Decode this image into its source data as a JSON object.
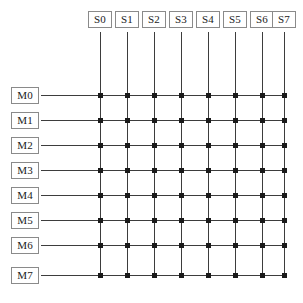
{
  "diagram": {
    "type": "bus-matrix",
    "colors": {
      "line": "#3d3d3d",
      "node": "#1a1a1a",
      "box_border": "#8a8a8a",
      "background": "#ffffff",
      "text": "#1a1a1a"
    },
    "columns": [
      {
        "label": "S0",
        "x": 100
      },
      {
        "label": "S1",
        "x": 127
      },
      {
        "label": "S2",
        "x": 154
      },
      {
        "label": "S3",
        "x": 181
      },
      {
        "label": "S4",
        "x": 208
      },
      {
        "label": "S5",
        "x": 235
      },
      {
        "label": "S6",
        "x": 262
      },
      {
        "label": "S7",
        "x": 284
      }
    ],
    "rows": [
      {
        "label": "M0",
        "y": 95
      },
      {
        "label": "M1",
        "y": 120
      },
      {
        "label": "M2",
        "y": 145
      },
      {
        "label": "M3",
        "y": 170
      },
      {
        "label": "M4",
        "y": 195
      },
      {
        "label": "M5",
        "y": 220
      },
      {
        "label": "M6",
        "y": 245
      },
      {
        "label": "M7",
        "y": 275
      }
    ],
    "geometry": {
      "col_label_y": 11,
      "col_label_w": 24,
      "col_label_h": 17,
      "row_label_x": 11,
      "row_label_w": 28,
      "row_label_h": 17,
      "vline_top": 32,
      "hline_left": 41,
      "node_size": 5
    },
    "node_count": 64
  }
}
